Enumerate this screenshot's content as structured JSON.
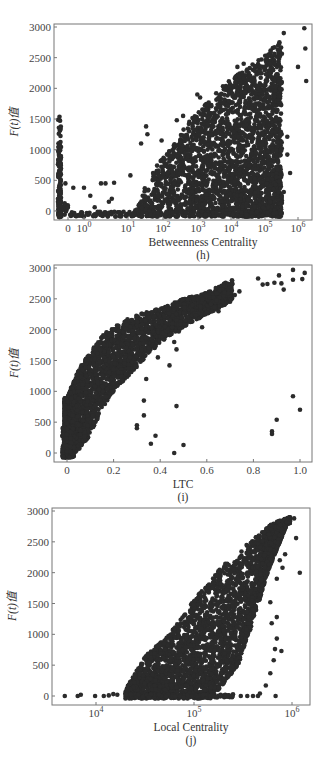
{
  "chart_data": [
    {
      "id": "h",
      "type": "scatter",
      "title": "",
      "sublabel": "(h)",
      "xlabel": "Betweenness Centrality",
      "ylabel": "F(t)值",
      "xscale": "log (with separate 0 column)",
      "xtick_labels": [
        "0",
        "10^0",
        "10^1",
        "10^2",
        "10^3",
        "10^4",
        "10^5",
        "10^6"
      ],
      "ytick_labels": [
        "0",
        "500",
        "1000",
        "1500",
        "2000",
        "2500",
        "3000"
      ],
      "ylim": [
        -120,
        3050
      ],
      "grid": false,
      "legend": null,
      "description": "Vertical column of points at x=0 reaching ~1550; sparse points for 10^0–10^1 near 0–500; dense wedge rising from 10^2 to 10^6 with max ~2950 near 10^6",
      "envelope": [
        {
          "log10x": 1.5,
          "ymax": 200
        },
        {
          "log10x": 2.0,
          "ymax": 700
        },
        {
          "log10x": 3.0,
          "ymax": 1500
        },
        {
          "log10x": 4.0,
          "ymax": 2100
        },
        {
          "log10x": 5.0,
          "ymax": 2500
        },
        {
          "log10x": 5.8,
          "ymax": 2950
        }
      ],
      "zero_column": {
        "ymin": -100,
        "ymax": 1550
      },
      "points": [
        {
          "x": 0.3,
          "y": 450
        },
        {
          "x": 0.5,
          "y": 380
        },
        {
          "x": 1,
          "y": 380
        },
        {
          "x": 1.5,
          "y": 250
        },
        {
          "x": 3,
          "y": 450
        },
        {
          "x": 4,
          "y": 450
        },
        {
          "x": 7,
          "y": 460
        },
        {
          "x": 2,
          "y": 60
        },
        {
          "x": 5,
          "y": 150
        },
        {
          "x": 6,
          "y": 200
        },
        {
          "x": 20,
          "y": 580
        },
        {
          "x": 40,
          "y": 1100
        },
        {
          "x": 55,
          "y": 1380
        },
        {
          "x": 60,
          "y": 1250
        },
        {
          "x": 150,
          "y": 1150
        },
        {
          "x": 400,
          "y": 1480
        },
        {
          "x": 600,
          "y": 1550
        },
        {
          "x": 1500,
          "y": 1900
        },
        {
          "x": 1800,
          "y": 1850
        },
        {
          "x": 20000,
          "y": 2350
        },
        {
          "x": 30000,
          "y": 2400
        },
        {
          "x": 150000,
          "y": 2550
        },
        {
          "x": 300000,
          "y": 2750
        },
        {
          "x": 400000,
          "y": 2900
        },
        {
          "x": 1500000,
          "y": 2980
        },
        {
          "x": 1600000,
          "y": 2650
        },
        {
          "x": 1700000,
          "y": 2120
        },
        {
          "x": 1000000,
          "y": 2350
        },
        {
          "x": 500000,
          "y": 1210
        },
        {
          "x": 600000,
          "y": 620
        },
        {
          "x": 500000,
          "y": 920
        },
        {
          "x": 400000,
          "y": 310
        }
      ]
    },
    {
      "id": "i",
      "type": "scatter",
      "title": "",
      "sublabel": "(i)",
      "xlabel": "LTC",
      "ylabel": "F(t)值",
      "xscale": "linear",
      "xtick_labels": [
        "0",
        "0.2",
        "0.4",
        "0.6",
        "0.8",
        "1.0"
      ],
      "ytick_labels": [
        "0",
        "500",
        "1000",
        "1500",
        "2000",
        "2500",
        "3000"
      ],
      "xlim": [
        -0.03,
        1.05
      ],
      "ylim": [
        -120,
        3050
      ],
      "grid": false,
      "legend": null,
      "description": "Dense concave band rising steeply from (0,0) to ~(0.2,2000) then flattening to ~(0.7,2750); scattered outliers",
      "band": [
        {
          "x": 0.0,
          "ylo": -80,
          "yhi": 900
        },
        {
          "x": 0.05,
          "ylo": 50,
          "yhi": 1350
        },
        {
          "x": 0.1,
          "ylo": 300,
          "yhi": 1650
        },
        {
          "x": 0.15,
          "ylo": 700,
          "yhi": 1900
        },
        {
          "x": 0.2,
          "ylo": 1000,
          "yhi": 2050
        },
        {
          "x": 0.3,
          "ylo": 1400,
          "yhi": 2250
        },
        {
          "x": 0.4,
          "ylo": 1800,
          "yhi": 2350
        },
        {
          "x": 0.5,
          "ylo": 2050,
          "yhi": 2500
        },
        {
          "x": 0.6,
          "ylo": 2250,
          "yhi": 2600
        },
        {
          "x": 0.7,
          "ylo": 2450,
          "yhi": 2800
        }
      ],
      "points": [
        {
          "x": 0.82,
          "y": 2830
        },
        {
          "x": 0.84,
          "y": 2730
        },
        {
          "x": 0.86,
          "y": 2740
        },
        {
          "x": 0.89,
          "y": 2760
        },
        {
          "x": 0.91,
          "y": 2880
        },
        {
          "x": 0.92,
          "y": 2750
        },
        {
          "x": 0.93,
          "y": 2650
        },
        {
          "x": 0.97,
          "y": 2970
        },
        {
          "x": 0.97,
          "y": 2810
        },
        {
          "x": 1.01,
          "y": 2820
        },
        {
          "x": 1.02,
          "y": 2920
        },
        {
          "x": 0.72,
          "y": 2560
        },
        {
          "x": 0.74,
          "y": 2620
        },
        {
          "x": 0.97,
          "y": 920
        },
        {
          "x": 1.0,
          "y": 700
        },
        {
          "x": 0.9,
          "y": 540
        },
        {
          "x": 0.88,
          "y": 350
        },
        {
          "x": 0.88,
          "y": 310
        },
        {
          "x": 0.33,
          "y": 850
        },
        {
          "x": 0.33,
          "y": 610
        },
        {
          "x": 0.3,
          "y": 450
        },
        {
          "x": 0.3,
          "y": 400
        },
        {
          "x": 0.38,
          "y": 280
        },
        {
          "x": 0.36,
          "y": 150
        },
        {
          "x": 0.47,
          "y": 760
        },
        {
          "x": 0.46,
          "y": 0
        },
        {
          "x": 0.5,
          "y": 130
        },
        {
          "x": 0.44,
          "y": 1420
        },
        {
          "x": 0.39,
          "y": 1550
        },
        {
          "x": 0.47,
          "y": 1680
        },
        {
          "x": 0.46,
          "y": 1800
        },
        {
          "x": 0.38,
          "y": 1730
        },
        {
          "x": 0.58,
          "y": 2040
        },
        {
          "x": 0.65,
          "y": 2300
        },
        {
          "x": 0.48,
          "y": 1970
        },
        {
          "x": 0.34,
          "y": 1200
        }
      ]
    },
    {
      "id": "j",
      "type": "scatter",
      "title": "",
      "sublabel": "(j)",
      "xlabel": "Local Centrality",
      "ylabel": "F(t)值",
      "xscale": "log",
      "xtick_labels": [
        "10^4",
        "10^5",
        "10^6"
      ],
      "ytick_labels": [
        "0",
        "500",
        "1000",
        "1500",
        "2000",
        "2500",
        "3000"
      ],
      "xlim_log10": [
        3.55,
        6.2
      ],
      "ylim": [
        -120,
        3050
      ],
      "grid": false,
      "legend": null,
      "description": "Points along y≈0 from ~5e3; dense triangular wedge starting ~2e4 rising to ~2900 near 1e6",
      "wedge": [
        {
          "log10x": 4.3,
          "ymax": 100
        },
        {
          "log10x": 4.5,
          "ymax": 650
        },
        {
          "log10x": 4.75,
          "ymax": 1000
        },
        {
          "log10x": 5.0,
          "ymax": 1550
        },
        {
          "log10x": 5.25,
          "ymax": 2050
        },
        {
          "log10x": 5.5,
          "ymax": 2400
        },
        {
          "log10x": 5.8,
          "ymax": 2800
        },
        {
          "log10x": 5.98,
          "ymax": 2900
        }
      ],
      "right_edge": [
        {
          "log10x": 5.2,
          "y": 0
        },
        {
          "log10x": 5.45,
          "y": 500
        },
        {
          "log10x": 5.6,
          "y": 1200
        },
        {
          "log10x": 5.75,
          "y": 2000
        },
        {
          "log10x": 5.95,
          "y": 2800
        }
      ],
      "points": [
        {
          "x": 4800,
          "y": 0
        },
        {
          "x": 6500,
          "y": 0
        },
        {
          "x": 7000,
          "y": 20
        },
        {
          "x": 9800,
          "y": 0
        },
        {
          "x": 12000,
          "y": 0
        },
        {
          "x": 13500,
          "y": 10
        },
        {
          "x": 15000,
          "y": 30
        },
        {
          "x": 16500,
          "y": 20
        },
        {
          "x": 20000,
          "y": 20
        },
        {
          "x": 300000,
          "y": 0
        },
        {
          "x": 350000,
          "y": 0
        },
        {
          "x": 400000,
          "y": 0
        },
        {
          "x": 450000,
          "y": 0
        },
        {
          "x": 470000,
          "y": 40
        },
        {
          "x": 680000,
          "y": 0
        },
        {
          "x": 540000,
          "y": 170
        },
        {
          "x": 600000,
          "y": 370
        },
        {
          "x": 650000,
          "y": 580
        },
        {
          "x": 670000,
          "y": 760
        },
        {
          "x": 780000,
          "y": 730
        },
        {
          "x": 700000,
          "y": 930
        },
        {
          "x": 620000,
          "y": 1180
        },
        {
          "x": 700000,
          "y": 1280
        },
        {
          "x": 600000,
          "y": 1520
        },
        {
          "x": 700000,
          "y": 1900
        },
        {
          "x": 800000,
          "y": 2080
        },
        {
          "x": 850000,
          "y": 2300
        },
        {
          "x": 1100000,
          "y": 2560
        },
        {
          "x": 1200000,
          "y": 2000
        },
        {
          "x": 1050000,
          "y": 2880
        },
        {
          "x": 380000,
          "y": 2480
        },
        {
          "x": 750000,
          "y": 2200
        }
      ]
    }
  ]
}
